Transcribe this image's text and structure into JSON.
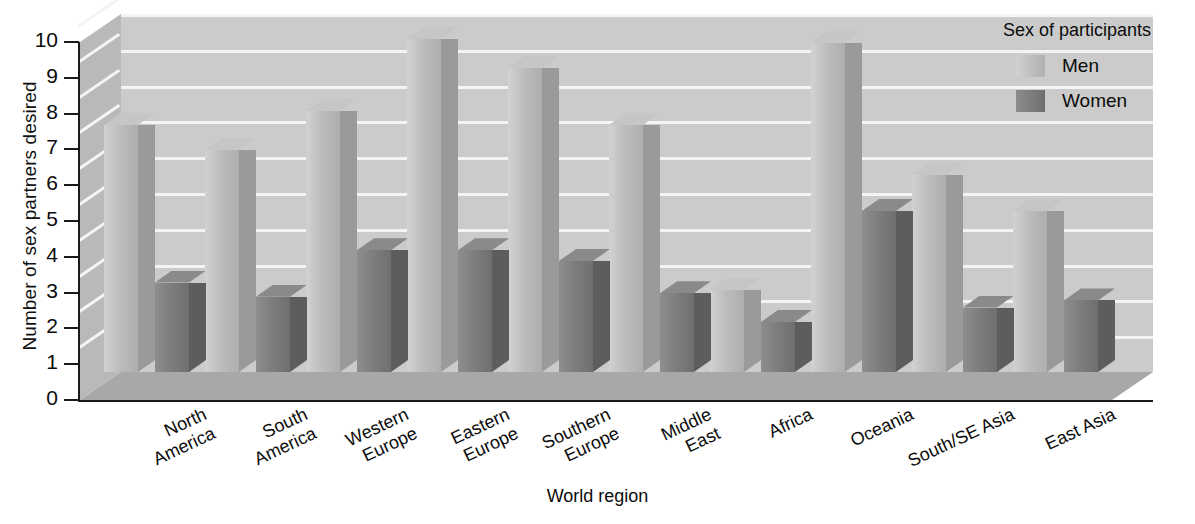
{
  "chart_data": {
    "type": "bar",
    "title": "",
    "xlabel": "World region",
    "ylabel": "Number of sex partners desired",
    "ylim": [
      0,
      10
    ],
    "ytick_labels": [
      "10",
      "9",
      "8",
      "7",
      "6",
      "5",
      "4",
      "3",
      "2",
      "1",
      "0"
    ],
    "grid": true,
    "legend_position": "top-right",
    "legend_title": "Sex of participants",
    "categories": [
      "North\nAmerica",
      "South\nAmerica",
      "Western\nEurope",
      "Eastern\nEurope",
      "Southern\nEurope",
      "Middle\nEast",
      "Africa",
      "Oceania",
      "South/SE Asia",
      "East Asia"
    ],
    "series": [
      {
        "name": "Men",
        "color": "#bdbdbd",
        "values": [
          6.9,
          6.2,
          7.3,
          9.3,
          8.5,
          6.9,
          2.3,
          9.2,
          5.5,
          4.5
        ]
      },
      {
        "name": "Women",
        "color": "#7e7e7e",
        "values": [
          2.5,
          2.1,
          3.4,
          3.4,
          3.1,
          2.2,
          1.4,
          4.5,
          1.8,
          2.0
        ]
      }
    ]
  }
}
